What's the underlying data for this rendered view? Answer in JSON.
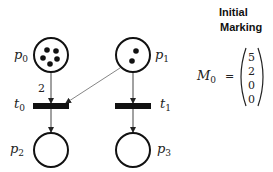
{
  "header": {
    "line1": "Initial",
    "line2": "Marking"
  },
  "marking": {
    "label": "M",
    "label_sub": "0",
    "equals": "=",
    "values": [
      "5",
      "2",
      "0",
      "0"
    ]
  },
  "places": [
    {
      "id": "p0",
      "name": "p",
      "sub": "0",
      "tokens": 5
    },
    {
      "id": "p1",
      "name": "p",
      "sub": "1",
      "tokens": 2
    },
    {
      "id": "p2",
      "name": "p",
      "sub": "2",
      "tokens": 0
    },
    {
      "id": "p3",
      "name": "p",
      "sub": "3",
      "tokens": 0
    }
  ],
  "transitions": [
    {
      "id": "t0",
      "name": "t",
      "sub": "0"
    },
    {
      "id": "t1",
      "name": "t",
      "sub": "1"
    }
  ],
  "arcs": [
    {
      "from": "p0",
      "to": "t0",
      "weight": "2"
    },
    {
      "from": "p1",
      "to": "t0",
      "weight": ""
    },
    {
      "from": "p1",
      "to": "t1",
      "weight": ""
    },
    {
      "from": "t0",
      "to": "p2",
      "weight": ""
    },
    {
      "from": "t1",
      "to": "p3",
      "weight": ""
    }
  ]
}
